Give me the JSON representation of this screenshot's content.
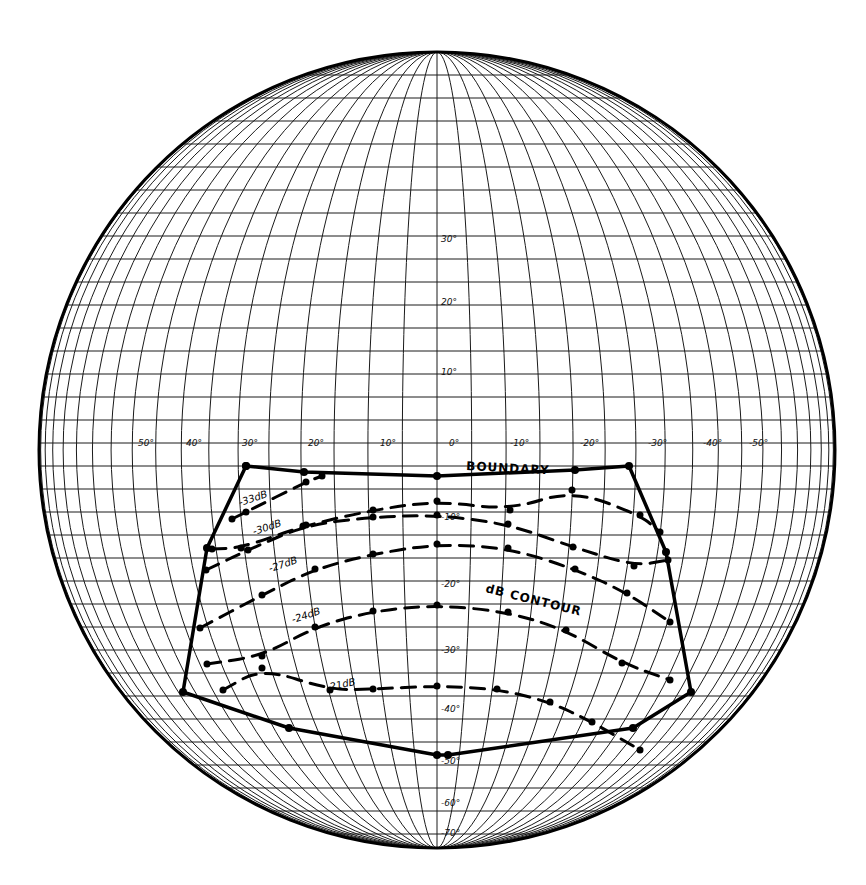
{
  "diagram": {
    "type": "globe-projection-contour-map",
    "colors": {
      "background": "#ffffff",
      "ink": "#000000",
      "grid": "#1a1a1a"
    },
    "longitude_labels": [
      {
        "text": "50°",
        "x": 138
      },
      {
        "text": "40°",
        "x": 186
      },
      {
        "text": "30°",
        "x": 242
      },
      {
        "text": "20°",
        "x": 308
      },
      {
        "text": "10°",
        "x": 380
      },
      {
        "text": "0°",
        "x": 449
      },
      {
        "text": "-10°",
        "x": 510
      },
      {
        "text": "-20°",
        "x": 580
      },
      {
        "text": "-30°",
        "x": 648
      },
      {
        "text": "-40°",
        "x": 703
      },
      {
        "text": "-50°",
        "x": 749
      }
    ],
    "latitude_labels": [
      {
        "text": "30°",
        "y": 242
      },
      {
        "text": "20°",
        "y": 305
      },
      {
        "text": "10°",
        "y": 375
      },
      {
        "text": "-10°",
        "y": 520
      },
      {
        "text": "-20°",
        "y": 587
      },
      {
        "text": "-30°",
        "y": 653
      },
      {
        "text": "-40°",
        "y": 712
      },
      {
        "text": "-50°",
        "y": 764
      },
      {
        "text": "-60°",
        "y": 806
      },
      {
        "text": "-70°",
        "y": 836
      }
    ],
    "annotations": {
      "boundary": "BOUNDARY",
      "contour": "dB CONTOUR",
      "db33": "-33dB",
      "db30": "-30dB",
      "db27": "-27dB",
      "db24": "-24dB",
      "db21": "-21dB"
    },
    "contours": [
      {
        "label": "-33dB",
        "points": [
          [
            232,
            519
          ],
          [
            246,
            512
          ],
          [
            306,
            482
          ],
          [
            322,
            476
          ]
        ]
      },
      {
        "label": "-30dB",
        "points": [
          [
            212,
            549
          ],
          [
            241,
            548
          ],
          [
            303,
            526
          ],
          [
            373,
            510
          ],
          [
            437,
            501
          ],
          [
            510,
            510
          ],
          [
            572,
            490
          ],
          [
            640,
            515
          ],
          [
            660,
            532
          ]
        ]
      },
      {
        "label": "-27dB",
        "points": [
          [
            206,
            570
          ],
          [
            248,
            550
          ],
          [
            306,
            525
          ],
          [
            373,
            517
          ],
          [
            437,
            515
          ],
          [
            508,
            524
          ],
          [
            573,
            547
          ],
          [
            634,
            566
          ],
          [
            668,
            560
          ]
        ]
      },
      {
        "label": "-24dB",
        "points": [
          [
            200,
            628
          ],
          [
            262,
            595
          ],
          [
            315,
            569
          ],
          [
            373,
            554
          ],
          [
            437,
            544
          ],
          [
            508,
            548
          ],
          [
            575,
            569
          ],
          [
            627,
            593
          ],
          [
            670,
            622
          ]
        ]
      },
      {
        "label": "-21dB",
        "points": [
          [
            207,
            664
          ],
          [
            262,
            656
          ],
          [
            315,
            627
          ],
          [
            373,
            611
          ],
          [
            437,
            605
          ],
          [
            508,
            612
          ],
          [
            566,
            630
          ],
          [
            622,
            663
          ],
          [
            670,
            680
          ]
        ]
      },
      {
        "label": "-18dB",
        "points": [
          [
            223,
            690
          ],
          [
            262,
            668
          ],
          [
            330,
            690
          ],
          [
            373,
            689
          ],
          [
            437,
            686
          ],
          [
            497,
            689
          ],
          [
            550,
            702
          ],
          [
            592,
            722
          ],
          [
            640,
            750
          ]
        ]
      }
    ],
    "boundary": [
      [
        246,
        466
      ],
      [
        304,
        472
      ],
      [
        437,
        476
      ],
      [
        575,
        470
      ],
      [
        629,
        466
      ],
      [
        666,
        552
      ],
      [
        691,
        692
      ],
      [
        633,
        728
      ],
      [
        448,
        755
      ],
      [
        437,
        755
      ],
      [
        289,
        728
      ],
      [
        183,
        692
      ],
      [
        207,
        548
      ],
      [
        246,
        466
      ]
    ]
  }
}
